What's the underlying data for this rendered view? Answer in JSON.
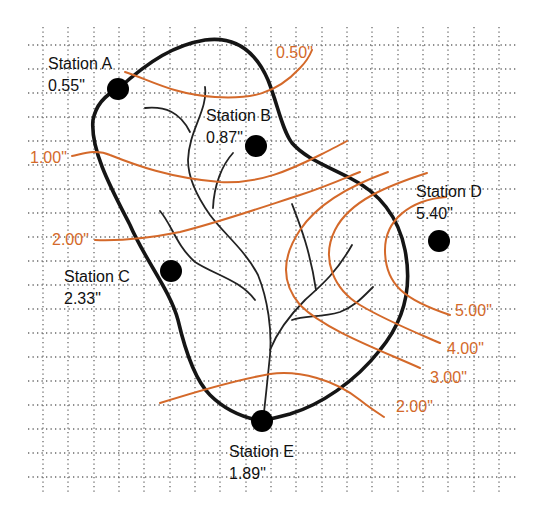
{
  "diagram": {
    "type": "watershed isohyetal map",
    "colors": {
      "background": "#ffffff",
      "grid": "#6a6a6a",
      "watershed_outline": "#151515",
      "streams": "#222222",
      "isohyets": "#d4692a",
      "station_marker": "#000000",
      "label_text": "#111111"
    },
    "stations": [
      {
        "id": "A",
        "name": "Station A",
        "rainfall": "0.55\""
      },
      {
        "id": "B",
        "name": "Station B",
        "rainfall": "0.87\""
      },
      {
        "id": "C",
        "name": "Station C",
        "rainfall": "2.33\""
      },
      {
        "id": "D",
        "name": "Station D",
        "rainfall": "5.40\""
      },
      {
        "id": "E",
        "name": "Station E",
        "rainfall": "1.89\""
      }
    ],
    "isohyets": [
      {
        "value": "0.50\""
      },
      {
        "value": "1.00\""
      },
      {
        "value": "2.00\"",
        "side": "left"
      },
      {
        "value": "2.00\"",
        "side": "right"
      },
      {
        "value": "3.00\""
      },
      {
        "value": "4.00\""
      },
      {
        "value": "5.00\""
      }
    ]
  }
}
